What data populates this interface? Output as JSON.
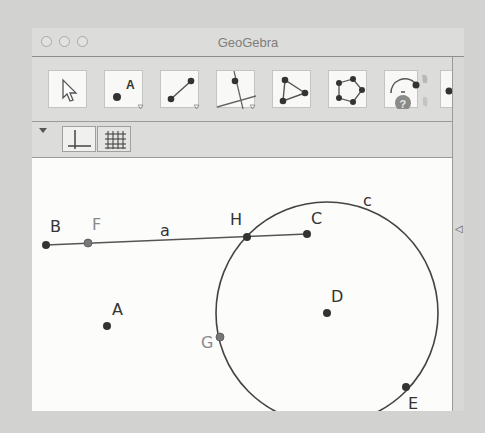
{
  "window": {
    "title": "GeoGebra",
    "traffic_lights": [
      "close",
      "minimize",
      "zoom"
    ]
  },
  "toolbar": {
    "tools": [
      {
        "name": "move-tool",
        "icon": "arrow-cursor-icon"
      },
      {
        "name": "point-tool",
        "icon": "point-icon",
        "label": "A",
        "has_menu": true
      },
      {
        "name": "segment-tool",
        "icon": "line-through-points-icon",
        "has_menu": true
      },
      {
        "name": "perpendicular-line-tool",
        "icon": "perpendicular-line-icon",
        "has_menu": true
      },
      {
        "name": "polygon-tool",
        "icon": "polygon-icon"
      },
      {
        "name": "regular-polygon-tool",
        "icon": "pentagon-icon"
      },
      {
        "name": "angle-tool",
        "icon": "circle-arc-icon",
        "help": "?"
      },
      {
        "name": "partial-tool",
        "icon": "point-partial-icon"
      }
    ]
  },
  "stylebar": {
    "buttons": [
      {
        "name": "show-axes-toggle",
        "icon": "axes-icon"
      },
      {
        "name": "show-grid-toggle",
        "icon": "grid-icon"
      }
    ]
  },
  "canvas": {
    "points": [
      {
        "name": "B",
        "x": 14,
        "y": 87,
        "fill": "#333333"
      },
      {
        "name": "F",
        "x": 56,
        "y": 85,
        "fill": "#777777"
      },
      {
        "name": "H",
        "x": 215,
        "y": 79,
        "fill": "#333333"
      },
      {
        "name": "C",
        "x": 275,
        "y": 76,
        "fill": "#333333"
      },
      {
        "name": "A",
        "x": 75,
        "y": 168,
        "fill": "#333333"
      },
      {
        "name": "D",
        "x": 295,
        "y": 155,
        "fill": "#333333"
      },
      {
        "name": "G",
        "x": 188,
        "y": 179,
        "fill": "#777777"
      },
      {
        "name": "E",
        "x": 374,
        "y": 229,
        "fill": "#333333"
      }
    ],
    "segment": {
      "name": "a",
      "from": "B",
      "to": "C"
    },
    "circle": {
      "name": "c",
      "center": "D",
      "cx": 295,
      "cy": 155,
      "r": 111
    },
    "labels": {
      "B": "B",
      "F": "F",
      "a": "a",
      "H": "H",
      "C": "C",
      "c": "c",
      "A": "A",
      "D": "D",
      "G": "G",
      "E": "E"
    }
  },
  "side_panel": {
    "collapse_icon": "◁"
  }
}
